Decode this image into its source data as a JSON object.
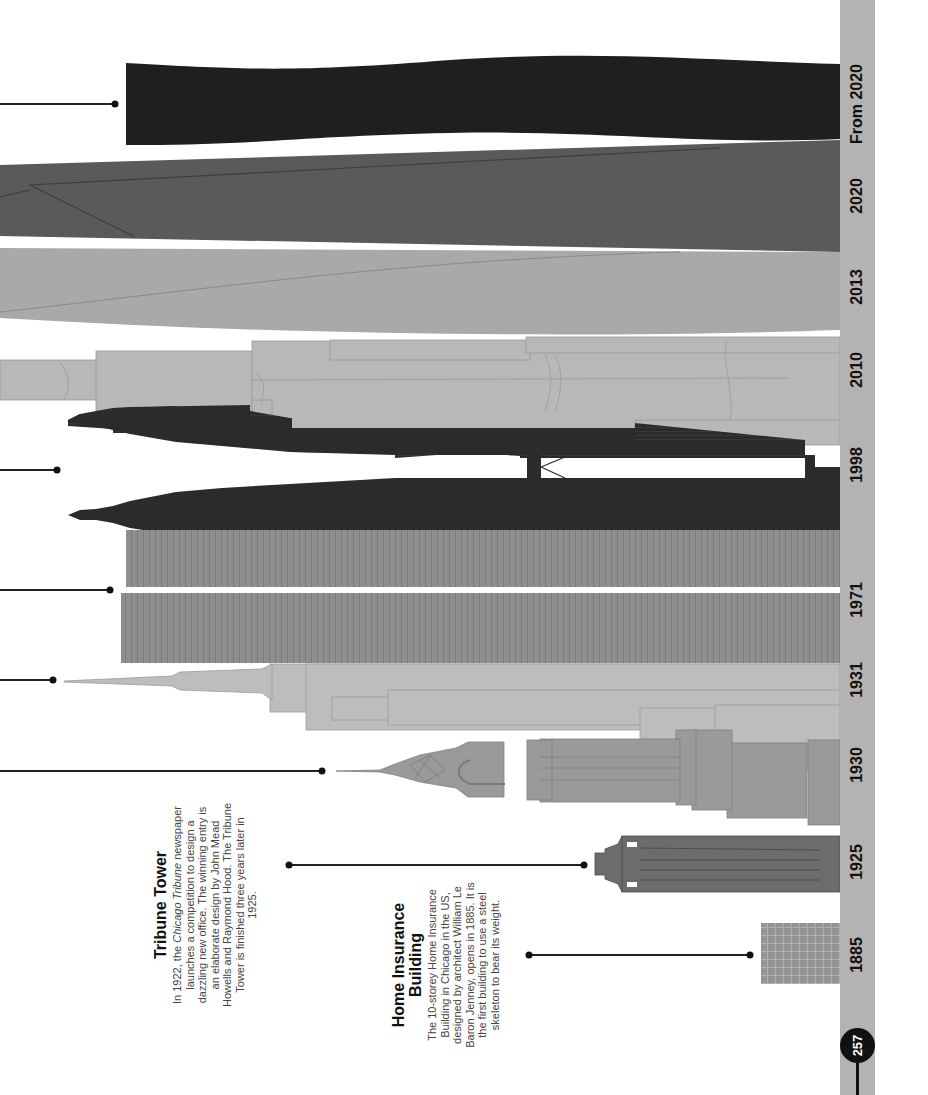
{
  "page": {
    "number": "257",
    "orientation": "rotated-90",
    "ground_color": "#b3b3b3"
  },
  "timeline": {
    "years": [
      {
        "label": "From 2020",
        "y": 104
      },
      {
        "label": "2020",
        "y": 196
      },
      {
        "label": "2013",
        "y": 287
      },
      {
        "label": "2010",
        "y": 370
      },
      {
        "label": "1998",
        "y": 465
      },
      {
        "label": "1971",
        "y": 600
      },
      {
        "label": "1931",
        "y": 680
      },
      {
        "label": "1930",
        "y": 765
      },
      {
        "label": "1925",
        "y": 862
      },
      {
        "label": "1885",
        "y": 955
      }
    ]
  },
  "buildings": [
    {
      "name": "from-2020-tower",
      "color": "#1f1f1f"
    },
    {
      "name": "2020-tower",
      "color": "#5a5a5a"
    },
    {
      "name": "2013-tower",
      "color": "#a9a9a9"
    },
    {
      "name": "2010-tower",
      "color": "#b8b8b8"
    },
    {
      "name": "1998-twin-towers",
      "color": "#2b2b2b"
    },
    {
      "name": "1971-twin-towers",
      "color": "#8e8e8e"
    },
    {
      "name": "1931-tower",
      "color": "#bdbdbd"
    },
    {
      "name": "1930-tower",
      "color": "#9a9a9a"
    },
    {
      "name": "1925-tower",
      "color": "#6c6c6c"
    },
    {
      "name": "1885-building",
      "color": "#959595"
    }
  ],
  "captions": {
    "tribune": {
      "title": "Tribune Tower",
      "body_pre": "In 1922, the ",
      "body_italic": "Chicago Tribune",
      "body_post": " newspaper launches a competition to design a dazzling new office. The winning entry is an elaborate design by John Mead Howells and Raymond Hood. The Tribune Tower is finished three years later in 1925."
    },
    "home_insurance": {
      "title": "Home Insurance Building",
      "body": "The 10-storey Home Insurance Building in Chicago in the US, designed by architect William Le Baron Jenney, opens in 1885. It is the first building to use a steel skeleton to bear its weight."
    }
  }
}
